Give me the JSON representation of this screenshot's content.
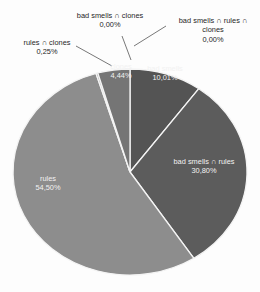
{
  "chart_data": {
    "type": "pie",
    "title": "",
    "subtitle": "",
    "xlabel": "",
    "ylabel": "",
    "grid": false,
    "legend_position": "none",
    "label_format": "comma-decimal-percent",
    "categories": [
      "bad smells",
      "bad smells ∩ rules",
      "rules",
      "rules ∩ clones",
      "clones",
      "bad smells ∩ clones",
      "bad smells ∩ rules ∩ clones"
    ],
    "values": [
      10.01,
      30.8,
      54.5,
      0.25,
      4.44,
      0.0,
      0.0
    ],
    "value_labels": [
      "10,01%",
      "30,80%",
      "54,50%",
      "0,25%",
      "4,44%",
      "0,00%",
      "0,00%"
    ],
    "colors": [
      "#545454",
      "#5c5c5c",
      "#8d8d8d",
      "#9a9a9a",
      "#757575",
      "#6b6b6b",
      "#4a4a4a"
    ],
    "slices": [
      {
        "name": "bad smells",
        "label": "bad smells",
        "value_label": "10,01%",
        "value": 10.01,
        "color": "#545454",
        "label_placement": "inside"
      },
      {
        "name": "bad smells ∩ rules",
        "label": "bad smells ∩ rules",
        "value_label": "30,80%",
        "value": 30.8,
        "color": "#5c5c5c",
        "label_placement": "inside"
      },
      {
        "name": "rules",
        "label": "rules",
        "value_label": "54,50%",
        "value": 54.5,
        "color": "#8d8d8d",
        "label_placement": "inside"
      },
      {
        "name": "rules ∩ clones",
        "label": "rules ∩ clones",
        "value_label": "0,25%",
        "value": 0.25,
        "color": "#9a9a9a",
        "label_placement": "outside-left"
      },
      {
        "name": "clones",
        "label": "clones",
        "value_label": "4,44%",
        "value": 4.44,
        "color": "#757575",
        "label_placement": "inside"
      },
      {
        "name": "bad smells ∩ clones",
        "label": "bad smells ∩ clones",
        "value_label": "0,00%",
        "value": 0.0,
        "color": "#6b6b6b",
        "label_placement": "outside-top"
      },
      {
        "name": "bad smells ∩ rules ∩ clones",
        "label": "bad smells ∩ rules ∩ clones",
        "value_label": "0,00%",
        "value": 0.0,
        "color": "#4a4a4a",
        "label_placement": "outside-top-right"
      }
    ]
  },
  "labels": {
    "bad_smells_clones": {
      "name": "bad smells ∩ clones",
      "value": "0,00%"
    },
    "bad_smells_rules_clones": {
      "name_line1": "bad smells ∩ rules ∩",
      "name_line2": "clones",
      "value": "0,00%"
    },
    "rules_clones": {
      "name": "rules ∩ clones",
      "value": "0,25%"
    },
    "clones": {
      "name": "clones",
      "value": "4,44%"
    },
    "bad_smells": {
      "name": "bad smells",
      "value": "10,01%"
    },
    "bad_smells_rules": {
      "name": "bad smells ∩ rules",
      "value": "30,80%"
    },
    "rules": {
      "name": "rules",
      "value": "54,50%"
    }
  }
}
